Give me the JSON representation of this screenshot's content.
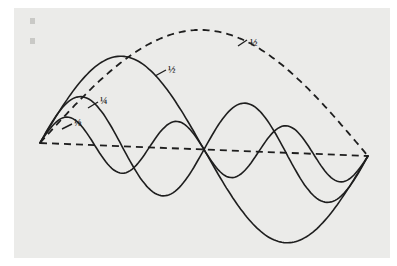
{
  "figure": {
    "type": "standing-wave-harmonics",
    "background_color": "#ebebe9",
    "line_color": "#1e1e1e",
    "baseline": {
      "style": "dashed",
      "x1": 40,
      "y1": 143,
      "x2": 368,
      "y2": 156
    },
    "curves": [
      {
        "id": "fundamental",
        "label": "½",
        "style": "dashed",
        "kind": "arch",
        "peak_y": 30,
        "label_pos": [
          250,
          43
        ],
        "leader_from": [
          238,
          46
        ],
        "leader_to": [
          247,
          40
        ]
      },
      {
        "id": "half",
        "label": "½",
        "style": "solid",
        "half_waves": 2,
        "amplitude": 90,
        "label_pos": [
          168,
          70
        ],
        "leader_from": [
          155,
          76
        ],
        "leader_to": [
          166,
          70
        ]
      },
      {
        "id": "quarter",
        "label": "¼",
        "style": "solid",
        "half_waves": 4,
        "amplitude": 48,
        "label_pos": [
          100,
          101
        ],
        "leader_from": [
          88,
          108
        ],
        "leader_to": [
          98,
          102
        ]
      },
      {
        "id": "eighth",
        "label": "⅛",
        "style": "solid",
        "half_waves": 6,
        "amplitude": 27,
        "label_pos": [
          74,
          123
        ],
        "leader_from": [
          62,
          129
        ],
        "leader_to": [
          72,
          124
        ]
      }
    ],
    "labels": [
      "½",
      "½",
      "¼",
      "⅛"
    ]
  }
}
